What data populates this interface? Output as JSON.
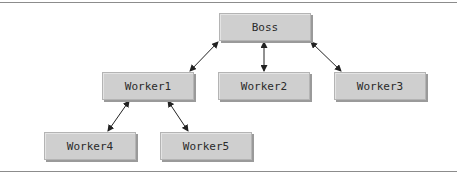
{
  "diagram": {
    "type": "hierarchy",
    "nodes": [
      {
        "id": "boss",
        "label": "Boss",
        "x": 219,
        "y": 13
      },
      {
        "id": "worker1",
        "label": "Worker1",
        "x": 102,
        "y": 72
      },
      {
        "id": "worker2",
        "label": "Worker2",
        "x": 218,
        "y": 72
      },
      {
        "id": "worker3",
        "label": "Worker3",
        "x": 334,
        "y": 72
      },
      {
        "id": "worker4",
        "label": "Worker4",
        "x": 44,
        "y": 132
      },
      {
        "id": "worker5",
        "label": "Worker5",
        "x": 160,
        "y": 132
      }
    ],
    "edges": [
      {
        "from": "boss",
        "to": "worker1",
        "bidirectional": true
      },
      {
        "from": "boss",
        "to": "worker2",
        "bidirectional": true
      },
      {
        "from": "boss",
        "to": "worker3",
        "bidirectional": true
      },
      {
        "from": "worker1",
        "to": "worker4",
        "bidirectional": true
      },
      {
        "from": "worker1",
        "to": "worker5",
        "bidirectional": true
      }
    ],
    "colors": {
      "box": "#cfcfcf",
      "border": "#b4b4b4",
      "shadow": "#9a9a9a",
      "rule": "#8c8c8c",
      "arrow": "#222222"
    }
  }
}
